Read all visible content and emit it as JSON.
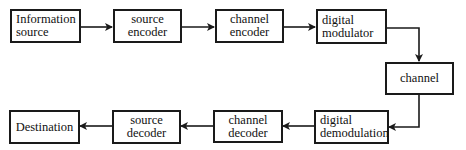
{
  "diagram": {
    "type": "block-diagram",
    "title": "",
    "nodes": [
      {
        "id": "info_source",
        "lines": [
          "Information",
          "source"
        ]
      },
      {
        "id": "source_encoder",
        "lines": [
          "source",
          "encoder"
        ]
      },
      {
        "id": "channel_encoder",
        "lines": [
          "channel",
          "encoder"
        ]
      },
      {
        "id": "digital_modulator",
        "lines": [
          "digital",
          "modulator"
        ]
      },
      {
        "id": "channel",
        "lines": [
          "channel"
        ]
      },
      {
        "id": "digital_demodulation",
        "lines": [
          "digital",
          "demodulation"
        ]
      },
      {
        "id": "channel_decoder",
        "lines": [
          "channel",
          "decoder"
        ]
      },
      {
        "id": "source_decoder",
        "lines": [
          "source",
          "decoder"
        ]
      },
      {
        "id": "destination",
        "lines": [
          "Destination"
        ]
      }
    ],
    "edges": [
      {
        "from": "info_source",
        "to": "source_encoder"
      },
      {
        "from": "source_encoder",
        "to": "channel_encoder"
      },
      {
        "from": "channel_encoder",
        "to": "digital_modulator"
      },
      {
        "from": "digital_modulator",
        "to": "channel"
      },
      {
        "from": "channel",
        "to": "digital_demodulation"
      },
      {
        "from": "digital_demodulation",
        "to": "channel_decoder"
      },
      {
        "from": "channel_decoder",
        "to": "source_decoder"
      },
      {
        "from": "source_decoder",
        "to": "destination"
      }
    ],
    "colors": {
      "stroke": "#1a1a1a",
      "background": "#ffffff"
    }
  }
}
